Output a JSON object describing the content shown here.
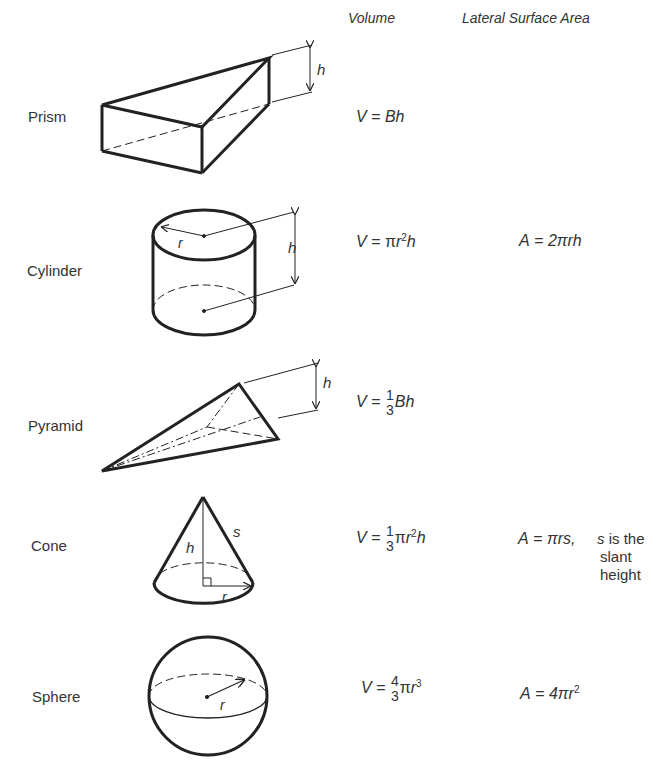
{
  "headers": {
    "volume": "Volume",
    "lateral_surface_area": "Lateral Surface Area"
  },
  "solids": [
    {
      "name": "Prism",
      "volume": {
        "lhs": "V",
        "eq": "=",
        "rhs": "Bh"
      },
      "area": null,
      "dimension_labels": [
        "h"
      ]
    },
    {
      "name": "Cylinder",
      "volume": {
        "lhs": "V",
        "eq": "=",
        "pi": "π",
        "var": "r",
        "exp": "2",
        "tail": "h"
      },
      "area": {
        "lhs": "A",
        "eq": "=",
        "rhs": "2πrh"
      },
      "dimension_labels": [
        "r",
        "h"
      ]
    },
    {
      "name": "Pyramid",
      "volume": {
        "lhs": "V",
        "eq": "=",
        "num": "1",
        "den": "3",
        "tail": "Bh"
      },
      "area": null,
      "dimension_labels": [
        "h"
      ]
    },
    {
      "name": "Cone",
      "volume": {
        "lhs": "V",
        "eq": "=",
        "num": "1",
        "den": "3",
        "pi": "π",
        "var": "r",
        "exp": "2",
        "tail": "h"
      },
      "area": {
        "lhs": "A",
        "eq": "=",
        "rhs": "πrs,",
        "note_var": "s",
        "note_line1": " is the",
        "note_line2": "slant",
        "note_line3": "height"
      },
      "dimension_labels": [
        "h",
        "s",
        "r"
      ]
    },
    {
      "name": "Sphere",
      "volume": {
        "lhs": "V",
        "eq": "=",
        "num": "4",
        "den": "3",
        "pi": "π",
        "var": "r",
        "exp": "3"
      },
      "area": {
        "lhs": "A",
        "eq": "=",
        "rhs": "4πr",
        "exp": "2"
      },
      "dimension_labels": [
        "r"
      ]
    }
  ]
}
